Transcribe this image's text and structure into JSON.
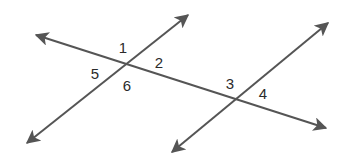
{
  "diagram": {
    "type": "two lines cut by a transversal",
    "colors": {
      "line": "#555555",
      "label": "#2b2b2b",
      "background": "#ffffff"
    },
    "lines": [
      {
        "name": "transversal",
        "from": [
          36,
          35
        ],
        "to": [
          326,
          128
        ],
        "arrows": "both"
      },
      {
        "name": "line-a",
        "from": [
          27,
          143
        ],
        "to": [
          188,
          15
        ],
        "arrows": "both"
      },
      {
        "name": "line-b",
        "from": [
          172,
          152
        ],
        "to": [
          328,
          23
        ],
        "arrows": "both"
      }
    ],
    "intersections": [
      {
        "name": "left",
        "point": [
          125,
          66
        ]
      },
      {
        "name": "right",
        "point": [
          231,
          100
        ]
      }
    ],
    "angle_labels": [
      {
        "text": "1",
        "x": 123,
        "y": 53
      },
      {
        "text": "2",
        "x": 159,
        "y": 68
      },
      {
        "text": "5",
        "x": 95,
        "y": 79
      },
      {
        "text": "6",
        "x": 127,
        "y": 91
      },
      {
        "text": "3",
        "x": 230,
        "y": 89
      },
      {
        "text": "4",
        "x": 263,
        "y": 99
      }
    ]
  }
}
